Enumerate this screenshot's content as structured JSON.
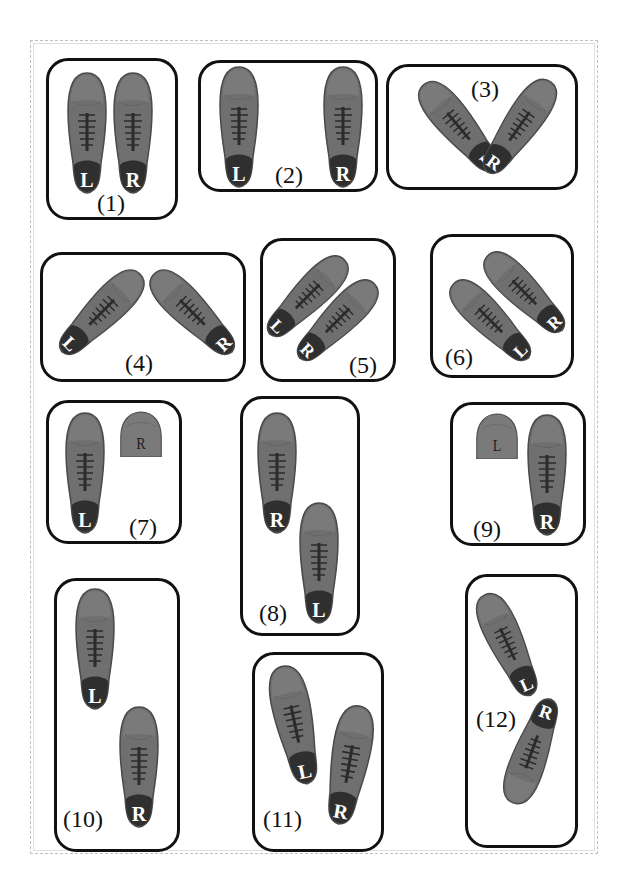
{
  "colors": {
    "shoe_body": "#6f6f6f",
    "shoe_toe": "#7d7d7d",
    "shoe_heel": "#2f2f2f",
    "shoe_outline": "#4a4a4a",
    "letter": "#ffffff",
    "panel_border": "#111111",
    "frame_border": "#bfbfbf"
  },
  "panels": [
    {
      "id": 1,
      "label": "(1)",
      "shoes": [
        {
          "side": "L",
          "letter": "L"
        },
        {
          "side": "R",
          "letter": "R"
        }
      ]
    },
    {
      "id": 2,
      "label": "(2)",
      "shoes": [
        {
          "side": "L",
          "letter": "L"
        },
        {
          "side": "R",
          "letter": "R"
        }
      ]
    },
    {
      "id": 3,
      "label": "(3)",
      "shoes": [
        {
          "side": "L",
          "letter": "L"
        },
        {
          "side": "R",
          "letter": "R"
        }
      ]
    },
    {
      "id": 4,
      "label": "(4)",
      "shoes": [
        {
          "side": "L",
          "letter": "L"
        },
        {
          "side": "R",
          "letter": "R"
        }
      ]
    },
    {
      "id": 5,
      "label": "(5)",
      "shoes": [
        {
          "side": "L",
          "letter": "L"
        },
        {
          "side": "R",
          "letter": "R"
        }
      ]
    },
    {
      "id": 6,
      "label": "(6)",
      "shoes": [
        {
          "side": "L",
          "letter": "L"
        },
        {
          "side": "R",
          "letter": "R"
        }
      ]
    },
    {
      "id": 7,
      "label": "(7)",
      "shoes": [
        {
          "side": "L",
          "letter": "L"
        }
      ],
      "partial_toe": {
        "letter": "R"
      }
    },
    {
      "id": 8,
      "label": "(8)",
      "shoes": [
        {
          "side": "R",
          "letter": "R"
        },
        {
          "side": "L",
          "letter": "L"
        }
      ]
    },
    {
      "id": 9,
      "label": "(9)",
      "shoes": [
        {
          "side": "R",
          "letter": "R"
        }
      ],
      "partial_toe": {
        "letter": "L"
      }
    },
    {
      "id": 10,
      "label": "(10)",
      "shoes": [
        {
          "side": "L",
          "letter": "L"
        },
        {
          "side": "R",
          "letter": "R"
        }
      ]
    },
    {
      "id": 11,
      "label": "(11)",
      "shoes": [
        {
          "side": "L",
          "letter": "L"
        },
        {
          "side": "R",
          "letter": "R"
        }
      ]
    },
    {
      "id": 12,
      "label": "(12)",
      "shoes": [
        {
          "side": "L",
          "letter": "L"
        },
        {
          "side": "R",
          "letter": "R"
        }
      ]
    }
  ]
}
